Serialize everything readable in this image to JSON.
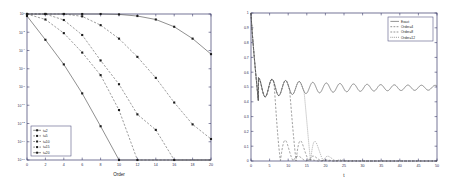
{
  "figure": {
    "background": "#ffffff",
    "panel_count": 2
  },
  "chart_data": [
    {
      "type": "line",
      "panel": "left",
      "title": "",
      "xlabel": "Order",
      "ylabel": "",
      "yscale": "log",
      "xlim": [
        0,
        20
      ],
      "ylim": [
        1e-16,
        1
      ],
      "grid": false,
      "legend_position": "lower-left",
      "xticks": [
        0,
        2,
        4,
        6,
        8,
        10,
        12,
        14,
        16,
        18,
        20
      ],
      "xticklabels": [
        "0",
        "2",
        "4",
        "6",
        "8",
        "10",
        "12",
        "14",
        "16",
        "18",
        "20"
      ],
      "yticks": [
        1,
        0.01,
        0.0001,
        1e-06,
        1e-08,
        1e-10,
        1e-12,
        1e-14,
        1e-16
      ],
      "yticklabels": [
        "10^0",
        "10^-2",
        "10^-4",
        "10^-6",
        "10^-8",
        "10^-10",
        "10^-12",
        "10^-14",
        "10^-16"
      ],
      "x": [
        0,
        2,
        4,
        6,
        8,
        10,
        12,
        14,
        16,
        18,
        20
      ],
      "series": [
        {
          "name": "t=2",
          "style": "solid-marker",
          "marker": "square",
          "values": [
            0.6,
            0.0015,
            3e-06,
            2e-09,
            5e-13,
            1e-16,
            1e-16,
            1e-16,
            1e-16,
            1e-16,
            1e-16
          ]
        },
        {
          "name": "t=5",
          "style": "dashed-marker",
          "marker": "square",
          "values": [
            1.0,
            0.25,
            0.008,
            6e-05,
            2e-07,
            3e-11,
            1e-16,
            1e-16,
            1e-16,
            1e-16,
            1e-16
          ]
        },
        {
          "name": "t=10",
          "style": "dashed-marker",
          "marker": "square",
          "values": [
            1.0,
            1.0,
            0.22,
            0.005,
            8e-06,
            2e-08,
            1e-11,
            2e-13,
            1e-16,
            1e-16,
            1e-16
          ]
        },
        {
          "name": "t=15",
          "style": "dashed-marker",
          "marker": "square",
          "values": [
            1.0,
            1.0,
            1.0,
            0.55,
            0.06,
            0.002,
            2e-05,
            1e-07,
            2e-10,
            8e-13,
            2e-14
          ]
        },
        {
          "name": "t=20",
          "style": "solid-marker",
          "marker": "square",
          "values": [
            1.0,
            1.0,
            1.0,
            1.0,
            1.0,
            0.9,
            0.6,
            0.25,
            0.04,
            0.002,
            4e-05
          ]
        }
      ]
    },
    {
      "type": "line",
      "panel": "right",
      "title": "",
      "xlabel": "t",
      "ylabel": "",
      "yscale": "linear",
      "xlim": [
        0,
        50
      ],
      "ylim": [
        0,
        1
      ],
      "grid": false,
      "legend_position": "upper-right",
      "xticks": [
        0,
        5,
        10,
        15,
        20,
        25,
        30,
        35,
        40,
        45,
        50
      ],
      "xticklabels": [
        "0",
        "5",
        "10",
        "15",
        "20",
        "25",
        "30",
        "35",
        "40",
        "45",
        "50"
      ],
      "yticks": [
        0,
        0.1,
        0.2,
        0.3,
        0.4,
        0.5,
        0.6,
        0.7,
        0.8,
        0.9,
        1
      ],
      "yticklabels": [
        "0",
        "0.1",
        "0.2",
        "0.3",
        "0.4",
        "0.5",
        "0.6",
        "0.7",
        "0.8",
        "0.9",
        "1"
      ],
      "series": [
        {
          "name": "Exact",
          "style": "solid",
          "description": "Starts at 1, drops sharply to 0.40 near t=2, oscillates around 0.5 with slowly decaying ripple, settles near 0.5 for large t"
        },
        {
          "name": "Order=4",
          "style": "dashed",
          "description": "Tracks exact until t~6 then decays with damped oscillations to near 0 by t~15"
        },
        {
          "name": "Order=8",
          "style": "dashed",
          "description": "Tracks exact until t~10 then decays with damped oscillations to near 0 by t~22"
        },
        {
          "name": "Order=12",
          "style": "dashed",
          "description": "Tracks exact until t~14 then decays with damped oscillations toward 0 by t~35"
        }
      ]
    }
  ],
  "left_panel": {
    "xlabel": "Order",
    "legend": [
      {
        "label": "t=2"
      },
      {
        "label": "t=5"
      },
      {
        "label": "t=10"
      },
      {
        "label": "t=15"
      },
      {
        "label": "t=20"
      }
    ],
    "xticklabels": [
      "0",
      "2",
      "4",
      "6",
      "8",
      "10",
      "12",
      "14",
      "16",
      "18",
      "20"
    ],
    "yticklabels": [
      "0",
      "-2",
      "-4",
      "-6",
      "-8",
      "-10",
      "-12",
      "-14",
      "-16"
    ],
    "ybase": "10"
  },
  "right_panel": {
    "xlabel": "t",
    "legend": [
      {
        "label": "Exact"
      },
      {
        "label": "Order=4"
      },
      {
        "label": "Order=8"
      },
      {
        "label": "Order=12"
      }
    ],
    "xticklabels": [
      "0",
      "5",
      "10",
      "15",
      "20",
      "25",
      "30",
      "35",
      "40",
      "45",
      "50"
    ],
    "yticklabels": [
      "0",
      "0.1",
      "0.2",
      "0.3",
      "0.4",
      "0.5",
      "0.6",
      "0.7",
      "0.8",
      "0.9",
      "1"
    ]
  }
}
